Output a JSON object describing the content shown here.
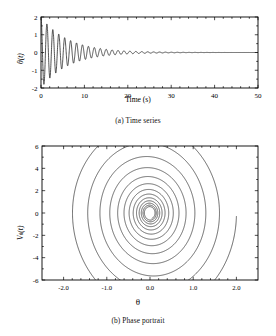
{
  "figure": {
    "background": "#ffffff",
    "line_color": "#1a1a1a",
    "axis_color": "#000000",
    "width": 276,
    "height": 336
  },
  "panel_a": {
    "caption": "(a) Time series",
    "xlabel": "Time (s)",
    "ylabel_main": "θ(t)",
    "ylabel_symbol": "θ",
    "ylabel_arg": "(t)",
    "xticks": [
      "0",
      "10",
      "20",
      "30",
      "40",
      "50"
    ],
    "yticks": [
      "2",
      "1",
      "0",
      "-1",
      "-2"
    ]
  },
  "panel_b": {
    "caption": "(b) Phase portrait",
    "xlabel": "θ",
    "ylabel_symbol": "V",
    "ylabel_sub": "θ",
    "ylabel_arg": "(t)",
    "xticks": [
      "-2.0",
      "-1.0",
      "0.0",
      "1.0",
      "2.0"
    ],
    "yticks": [
      "6",
      "4",
      "2",
      "0",
      "-2",
      "-4",
      "-6"
    ]
  },
  "chart_data": [
    {
      "type": "line",
      "id": "time-series",
      "title": "(a) Time series",
      "xlabel": "Time (s)",
      "ylabel": "θ(t)",
      "xlim": [
        0,
        50
      ],
      "ylim": [
        -2,
        2
      ],
      "xticks": [
        0,
        10,
        20,
        30,
        40,
        50
      ],
      "yticks": [
        -2,
        -1,
        0,
        1,
        2
      ],
      "grid": false,
      "legend": "none",
      "description": "Damped oscillation of a pendulum angle decaying to zero",
      "model": "theta(t) = 2.0 * exp(-0.16*t) * cos(4.6*t)",
      "series": [
        {
          "name": "theta(t)",
          "amplitude_envelope": [
            {
              "t": 0,
              "amp": 2.0
            },
            {
              "t": 2,
              "amp": 1.45
            },
            {
              "t": 4,
              "amp": 1.06
            },
            {
              "t": 6,
              "amp": 0.77
            },
            {
              "t": 8,
              "amp": 0.56
            },
            {
              "t": 10,
              "amp": 0.4
            },
            {
              "t": 12,
              "amp": 0.29
            },
            {
              "t": 14,
              "amp": 0.21
            },
            {
              "t": 16,
              "amp": 0.16
            },
            {
              "t": 18,
              "amp": 0.11
            },
            {
              "t": 20,
              "amp": 0.08
            },
            {
              "t": 24,
              "amp": 0.043
            },
            {
              "t": 28,
              "amp": 0.023
            },
            {
              "t": 32,
              "amp": 0.012
            },
            {
              "t": 36,
              "amp": 0.006
            },
            {
              "t": 40,
              "amp": 0.003
            },
            {
              "t": 45,
              "amp": 0.001
            },
            {
              "t": 50,
              "amp": 0.0
            }
          ],
          "period": 1.366,
          "decay_rate": 0.16,
          "initial_value": 2.0,
          "final_value": 0.0
        }
      ]
    },
    {
      "type": "line",
      "id": "phase-portrait",
      "title": "(b) Phase portrait",
      "xlabel": "θ",
      "ylabel": "Vθ(t)",
      "xlim": [
        -2.5,
        2.5
      ],
      "ylim": [
        -6,
        6
      ],
      "xticks": [
        -2.0,
        -1.0,
        0.0,
        1.0,
        2.0
      ],
      "yticks": [
        -6,
        -4,
        -2,
        0,
        2,
        4,
        6
      ],
      "grid": false,
      "legend": "none",
      "description": "Inward spiral trajectory converging on a stable focus at the origin",
      "model": "r(t) = r0 * exp(-0.16*t), theta angle advances at 4.6 rad/s; x = r*cos, y = 3.2*r*sin",
      "series": [
        {
          "name": "trajectory",
          "start_point": [
            2.0,
            -1.5
          ],
          "end_point": [
            0.0,
            0.0
          ],
          "fixed_point": [
            0.0,
            0.0
          ],
          "radius_decay_per_turn": 0.78,
          "turns": 13,
          "x_extent_first_turn": [
            -1.7,
            2.0
          ],
          "y_extent_first_turn": [
            -5.0,
            4.4
          ]
        }
      ]
    }
  ]
}
